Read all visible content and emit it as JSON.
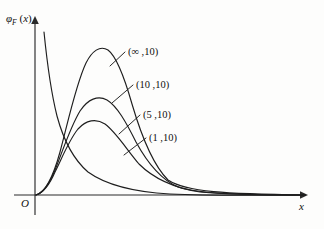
{
  "figure": {
    "background_color": "#fdfdfc",
    "line_color": "#1e1e1e",
    "axis_color": "#2b2b2b"
  },
  "axes": {
    "y_label_symbol": "φ",
    "y_label_subscript": "F",
    "y_label_arg": "(x)",
    "y_label_full": "φ_F(x)",
    "x_label": "x",
    "origin_label": "O",
    "x_axis_y_px": 195,
    "y_axis_x_px": 35,
    "x_axis_start_px": 14,
    "x_axis_end_px": 305,
    "y_axis_top_px": 18
  },
  "legend_labels": [
    {
      "text": "(∞ ,10)",
      "m": "∞",
      "n": "10",
      "x": 128,
      "y": 55
    },
    {
      "text": "(10 ,10)",
      "m": "10",
      "n": "10",
      "x": 136,
      "y": 88
    },
    {
      "text": "(5 ,10)",
      "m": "5",
      "n": "10",
      "x": 143,
      "y": 118
    },
    {
      "text": "(1 ,10)",
      "m": "1",
      "n": "10",
      "x": 149,
      "y": 141
    }
  ],
  "chart_data": {
    "type": "line",
    "title": "",
    "xlabel": "x",
    "ylabel": "φ_F(x)",
    "grid": false,
    "legend_position": "inline-annotations",
    "axis_arrows": true,
    "xlim": [
      0,
      8
    ],
    "ylim": [
      0,
      1.05
    ],
    "x_ticks": [],
    "y_ticks": [],
    "series": [
      {
        "name": "(∞ ,10)",
        "m": "∞",
        "n": 10,
        "peak_x": 0.95,
        "peak_y": 1.0,
        "path": "M 36,195 C 44,193 52,181 60,152 C 68,122 76,84 86,63 C 92,51 100,45 108,50 C 116,56 124,76 132,104 C 142,138 154,166 168,180 C 186,192 226,194 305,195"
      },
      {
        "name": "(10 ,10)",
        "m": 10,
        "n": 10,
        "peak_x": 0.82,
        "peak_y": 0.78,
        "path": "M 36,195 C 43,193 50,184 57,165 C 64,147 71,126 80,111 C 88,99 98,95 107,100 C 117,106 126,122 136,142 C 148,164 162,180 178,187 C 200,194 240,195 305,195"
      },
      {
        "name": "(5 ,10)",
        "m": 5,
        "n": 10,
        "peak_x": 0.72,
        "peak_y": 0.62,
        "path": "M 36,195 C 43,193 49,186 55,172 C 62,158 69,140 78,129 C 86,120 96,118 105,124 C 116,132 127,150 139,164 C 155,180 175,188 200,192 C 235,195 270,195 305,195"
      },
      {
        "name": "(1 ,10)",
        "m": 1,
        "n": 10,
        "monotone_decreasing": true,
        "note": "steeply decaying from near y-axis",
        "path": "M 44,32 C 47,62 51,92 57,116 C 64,142 74,160 88,172 C 106,185 134,192 170,194 C 215,196 260,195 305,195"
      }
    ],
    "leaders": [
      {
        "for": "(∞ ,10)",
        "x1": 110,
        "y1": 66,
        "x2": 125,
        "y2": 52
      },
      {
        "for": "(10 ,10)",
        "x1": 112,
        "y1": 103,
        "x2": 133,
        "y2": 85
      },
      {
        "for": "(5 ,10)",
        "x1": 119,
        "y1": 134,
        "x2": 140,
        "y2": 115
      },
      {
        "for": "(1 ,10)",
        "x1": 124,
        "y1": 155,
        "x2": 146,
        "y2": 138
      }
    ]
  }
}
